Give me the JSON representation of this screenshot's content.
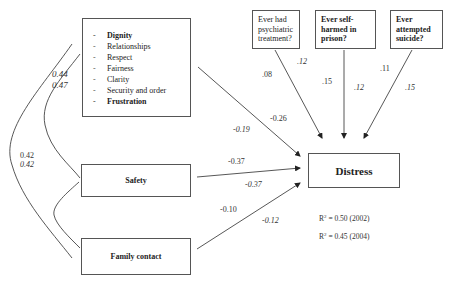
{
  "diagram": {
    "type": "path-model",
    "boxes": {
      "dignity_group": {
        "items": [
          {
            "label": "Dignity",
            "bold": true
          },
          {
            "label": "Relationships",
            "bold": false
          },
          {
            "label": "Respect",
            "bold": false
          },
          {
            "label": "Fairness",
            "bold": false
          },
          {
            "label": "Clarity",
            "bold": false
          },
          {
            "label": "Security and order",
            "bold": false
          },
          {
            "label": "Frustration",
            "bold": true
          }
        ],
        "dash": "-"
      },
      "safety": {
        "label": "Safety"
      },
      "family_contact": {
        "label": "Family contact"
      },
      "psychiatric": {
        "label": "Ever had psychiatric treatment?"
      },
      "self_harm": {
        "label": "Ever self-harmed in prison?"
      },
      "suicide": {
        "label": "Ever attempted suicide?"
      },
      "distress": {
        "label": "Distress"
      }
    },
    "paths": {
      "dignity_to_distress": {
        "v2002": "-0.26",
        "v2004": "-0.19"
      },
      "safety_to_distress": {
        "v2002": "-0.37",
        "v2004": "-0.37"
      },
      "family_to_distress": {
        "v2002": "-0.10",
        "v2004": "-0.12"
      },
      "psychiatric_to_distress": {
        "v2002": ".08",
        "v2004": ".12"
      },
      "self_harm_to_distress": {
        "v2002": ".15",
        "v2004": ".12"
      },
      "suicide_to_distress": {
        "v2002": ".11",
        "v2004": ".15"
      }
    },
    "correlations": {
      "dignity_safety": {
        "v2002": "0.44",
        "v2004": "0.47"
      },
      "dignity_family": {
        "v2002": "0.42",
        "v2004": "0.42"
      }
    },
    "r_squared": [
      {
        "prefix": "R",
        "sup": "2",
        "text": " = 0.50 (2002)"
      },
      {
        "prefix": "R",
        "sup": "2",
        "text": " = 0.45 (2004)"
      }
    ],
    "colors": {
      "line": "#444444",
      "border": "#555555",
      "text": "#222222"
    }
  }
}
